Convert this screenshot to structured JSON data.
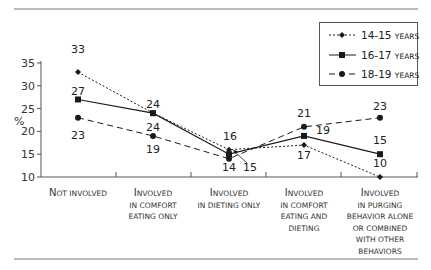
{
  "chart_data": {
    "type": "line",
    "title": "",
    "xlabel": "",
    "ylabel": "%",
    "ylim": [
      10,
      35
    ],
    "yticks": [
      10,
      15,
      20,
      25,
      30,
      35
    ],
    "grid": false,
    "legend_position": "top-right",
    "categories": [
      "Not involved",
      "Involved in comfort eating only",
      "Involved in dieting only",
      "Involved in comfort eating and dieting",
      "Involved in purging behavior alone or combined with other behaviors"
    ],
    "category_lines": [
      [
        "Not involved"
      ],
      [
        "Involved",
        "in comfort",
        "eating only"
      ],
      [
        "Involved",
        "in dieting only"
      ],
      [
        "Involved",
        "in comfort",
        "eating and",
        "dieting"
      ],
      [
        "Involved",
        "in purging",
        "behavior alone",
        "or combined",
        "with other",
        "behaviors"
      ]
    ],
    "series": [
      {
        "name": "14-15 years",
        "values": [
          33,
          24,
          16,
          17,
          10
        ],
        "style": "dotted",
        "marker": "diamond"
      },
      {
        "name": "16-17 years",
        "values": [
          27,
          24,
          15,
          19,
          15
        ],
        "style": "solid",
        "marker": "square"
      },
      {
        "name": "18-19 years",
        "values": [
          23,
          19,
          14,
          21,
          23
        ],
        "style": "dashed",
        "marker": "circle"
      }
    ]
  },
  "legend": [
    {
      "num": "14-15",
      "unit": "years"
    },
    {
      "num": "16-17",
      "unit": "years"
    },
    {
      "num": "18-19",
      "unit": "years"
    }
  ],
  "labels": {
    "y_axis": "%",
    "point_labels": [
      {
        "text": "33",
        "x": 78,
        "y": 53
      },
      {
        "text": "27",
        "x": 78,
        "y": 95
      },
      {
        "text": "23",
        "x": 78,
        "y": 139
      },
      {
        "text": "24",
        "x": 153,
        "y": 108
      },
      {
        "text": "24",
        "x": 153,
        "y": 131
      },
      {
        "text": "19",
        "x": 153,
        "y": 153
      },
      {
        "text": "16",
        "x": 230,
        "y": 140
      },
      {
        "text": "14",
        "x": 229,
        "y": 171
      },
      {
        "text": "15",
        "x": 250,
        "y": 171
      },
      {
        "text": "21",
        "x": 304,
        "y": 117
      },
      {
        "text": "19",
        "x": 323,
        "y": 134
      },
      {
        "text": "17",
        "x": 304,
        "y": 159
      },
      {
        "text": "23",
        "x": 380,
        "y": 110
      },
      {
        "text": "15",
        "x": 380,
        "y": 144
      },
      {
        "text": "10",
        "x": 380,
        "y": 167
      }
    ]
  }
}
